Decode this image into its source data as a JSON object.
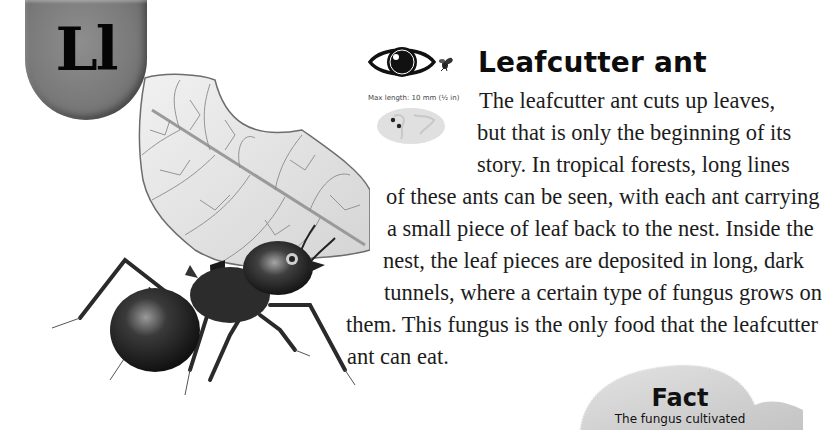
{
  "letter_tab": {
    "label": "Ll"
  },
  "size_panel": {
    "icons": [
      "eye-icon",
      "fly-icon",
      "world-map-icon"
    ],
    "max_length": "Max length: 10 mm (½ in)"
  },
  "entry": {
    "title": "Leafcutter ant",
    "body_lines": [
      "The leafcutter ant cuts up leaves,",
      "but that is only the beginning of its",
      "story. In tropical forests, long lines",
      "of these ants can be seen, with each ant carrying",
      "a small piece of leaf back to the nest. Inside the",
      "nest, the leaf pieces are deposited in long, dark",
      "tunnels, where a certain type of fungus grows on",
      "them. This fungus is the only food that the leafcutter",
      "ant can eat."
    ]
  },
  "fact_box": {
    "title": "Fact",
    "text": "The fungus cultivated"
  },
  "colors": {
    "tab_gray": "#7a7a7a",
    "text": "#1a1a1a",
    "background": "#ffffff",
    "fact_blob": "#d6d6d6"
  }
}
